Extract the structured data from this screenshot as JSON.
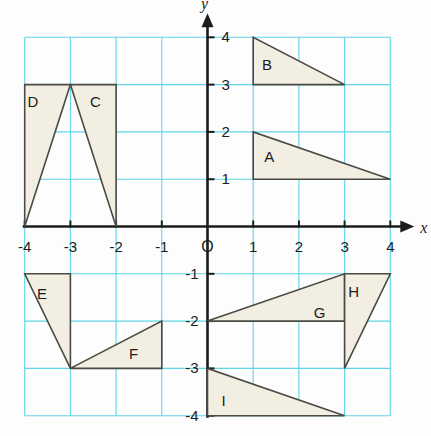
{
  "figure": {
    "title": "",
    "axis_labels": {
      "x": "x",
      "y": "y"
    },
    "origin_label": "O",
    "colors": {
      "background": "#fdfdfd",
      "grid": "#5fd5e8",
      "axis": "#1c1c1c",
      "shape_fill": "#f2efe2",
      "shape_stroke": "#4a4a44",
      "text": "#1c1c1c"
    }
  },
  "chart_data": {
    "type": "scatter",
    "title": "",
    "xlabel": "x",
    "ylabel": "y",
    "xlim": [
      -4,
      4
    ],
    "ylim": [
      -4,
      4
    ],
    "grid": true,
    "legend": "none",
    "x_ticks": [
      "-4",
      "-3",
      "-2",
      "-1",
      "O",
      "1",
      "2",
      "3",
      "4"
    ],
    "x_tick_values": [
      -4,
      -3,
      -2,
      -1,
      0,
      1,
      2,
      3,
      4
    ],
    "y_ticks": [
      "4",
      "3",
      "2",
      "1",
      "-1",
      "-2",
      "-3",
      "-4"
    ],
    "y_tick_values": [
      4,
      3,
      2,
      1,
      -1,
      -2,
      -3,
      -4
    ],
    "shapes": [
      {
        "label": "A",
        "kind": "triangle",
        "vertices": [
          [
            1,
            2
          ],
          [
            1,
            1
          ],
          [
            4,
            1
          ]
        ],
        "label_pos": [
          1.35,
          1.45
        ]
      },
      {
        "label": "B",
        "kind": "triangle",
        "vertices": [
          [
            1,
            4
          ],
          [
            1,
            3
          ],
          [
            3,
            3
          ]
        ],
        "label_pos": [
          1.3,
          3.4
        ]
      },
      {
        "label": "C",
        "kind": "triangle",
        "vertices": [
          [
            -3,
            3
          ],
          [
            -2,
            3
          ],
          [
            -2,
            0
          ]
        ],
        "label_pos": [
          -2.45,
          2.6
        ]
      },
      {
        "label": "D",
        "kind": "triangle",
        "vertices": [
          [
            -4,
            3
          ],
          [
            -3,
            3
          ],
          [
            -4,
            0
          ]
        ],
        "label_pos": [
          -3.82,
          2.6
        ]
      },
      {
        "label": "E",
        "kind": "triangle",
        "vertices": [
          [
            -4,
            -1
          ],
          [
            -3,
            -1
          ],
          [
            -3,
            -3
          ]
        ],
        "label_pos": [
          -3.62,
          -1.45
        ]
      },
      {
        "label": "F",
        "kind": "triangle",
        "vertices": [
          [
            -3,
            -3
          ],
          [
            -1,
            -3
          ],
          [
            -1,
            -2
          ]
        ],
        "label_pos": [
          -1.62,
          -2.72
        ]
      },
      {
        "label": "G",
        "kind": "triangle",
        "vertices": [
          [
            0,
            -2
          ],
          [
            3,
            -2
          ],
          [
            3,
            -1
          ]
        ],
        "label_pos": [
          2.45,
          -1.85
        ]
      },
      {
        "label": "H",
        "kind": "triangle",
        "vertices": [
          [
            3,
            -1
          ],
          [
            4,
            -1
          ],
          [
            3,
            -3
          ]
        ],
        "label_pos": [
          3.2,
          -1.4
        ]
      },
      {
        "label": "I",
        "kind": "triangle",
        "vertices": [
          [
            0,
            -3
          ],
          [
            0,
            -4
          ],
          [
            3,
            -4
          ]
        ],
        "label_pos": [
          0.35,
          -3.72
        ]
      }
    ]
  }
}
